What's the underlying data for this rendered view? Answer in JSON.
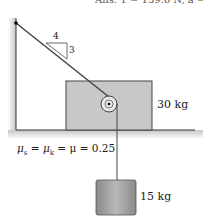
{
  "answer_text": "Ans. T = 159.6 N, a = 0.",
  "slope": {
    "run": "4",
    "rise": "3"
  },
  "block": {
    "mass_label": "30 kg",
    "color": "#c8c8c8"
  },
  "hanging": {
    "mass_label": "15 kg",
    "color": "#a8a8a8"
  },
  "friction": {
    "text": "μs = μk = μ = 0.25",
    "prefix": "μ",
    "s": "s",
    "k": "k",
    "value": "= μ = 0.25"
  }
}
